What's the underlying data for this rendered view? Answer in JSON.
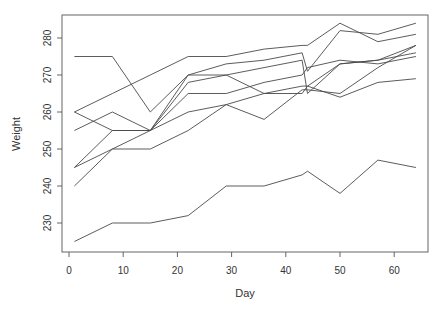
{
  "chart_data": {
    "type": "line",
    "title": "",
    "xlabel": "Day",
    "ylabel": "Weight",
    "xlim": [
      -1,
      66
    ],
    "ylim": [
      223,
      286
    ],
    "xticks": [
      0,
      10,
      20,
      30,
      40,
      50,
      60
    ],
    "yticks": [
      230,
      240,
      250,
      260,
      270,
      280
    ],
    "grid": false,
    "legend": null,
    "x": [
      1,
      8,
      15,
      22,
      29,
      36,
      43,
      44,
      50,
      57,
      64
    ],
    "series": [
      {
        "name": "rat 1",
        "values": [
          240,
          250,
          255,
          260,
          262,
          258,
          266,
          266,
          265,
          272,
          278
        ]
      },
      {
        "name": "rat 2",
        "values": [
          225,
          230,
          230,
          232,
          240,
          240,
          243,
          244,
          238,
          247,
          245
        ]
      },
      {
        "name": "rat 3",
        "values": [
          245,
          250,
          250,
          255,
          262,
          265,
          267,
          267,
          264,
          268,
          269
        ]
      },
      {
        "name": "rat 4",
        "values": [
          260,
          255,
          255,
          265,
          265,
          268,
          270,
          272,
          274,
          273,
          275
        ]
      },
      {
        "name": "rat 5",
        "values": [
          255,
          260,
          255,
          270,
          270,
          265,
          265,
          267,
          273,
          274,
          276
        ]
      },
      {
        "name": "rat 6",
        "values": [
          260,
          265,
          270,
          275,
          275,
          277,
          278,
          278,
          284,
          279,
          281
        ]
      },
      {
        "name": "rat 7",
        "values": [
          275,
          275,
          260,
          270,
          273,
          274,
          276,
          271,
          282,
          281,
          284
        ]
      },
      {
        "name": "rat 8",
        "values": [
          245,
          255,
          255,
          268,
          270,
          272,
          274,
          265,
          273,
          274,
          278
        ]
      }
    ]
  },
  "axes": {
    "x_tick_labels": [
      "0",
      "10",
      "20",
      "30",
      "40",
      "50",
      "60"
    ],
    "y_tick_labels": [
      "230",
      "240",
      "250",
      "260",
      "270",
      "280"
    ],
    "xlabel": "Day",
    "ylabel": "Weight"
  }
}
